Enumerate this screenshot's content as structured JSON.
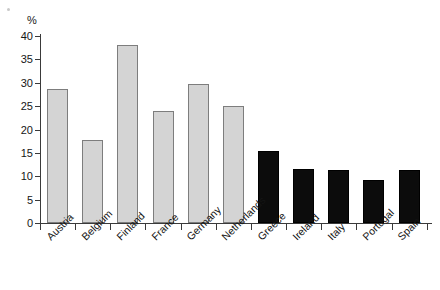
{
  "chart_data": {
    "type": "bar",
    "title": "",
    "subtitle": "",
    "xlabel": "",
    "ylabel": "%",
    "ylim": [
      0,
      40
    ],
    "ytick_values": [
      0,
      5,
      10,
      15,
      20,
      25,
      30,
      35,
      40
    ],
    "ytick_labels": [
      "0",
      "5",
      "10",
      "15",
      "20",
      "25",
      "30",
      "35",
      "40"
    ],
    "grid": false,
    "legend": null,
    "categories": [
      "Austria",
      "Belgium",
      "Finland",
      "France",
      "Germany",
      "Netherlands",
      "Greece",
      "Ireland",
      "Italy",
      "Portugal",
      "Spain"
    ],
    "values": [
      28.7,
      17.8,
      38.0,
      24.0,
      29.8,
      25.0,
      15.4,
      11.5,
      11.3,
      9.2,
      11.3
    ],
    "bar_colors": [
      "#d4d4d4",
      "#d4d4d4",
      "#d4d4d4",
      "#d4d4d4",
      "#d4d4d4",
      "#d4d4d4",
      "#0c0c0c",
      "#0c0c0c",
      "#0c0c0c",
      "#0c0c0c",
      "#0c0c0c"
    ],
    "bar_groups": [
      "light",
      "light",
      "light",
      "light",
      "light",
      "light",
      "dark",
      "dark",
      "dark",
      "dark",
      "dark"
    ],
    "colors": {
      "light_bar_fill": "#d4d4d4",
      "light_bar_edge": "#7d7d7d",
      "dark_bar_fill": "#0c0c0c",
      "dark_bar_edge": "#000000",
      "axis": "#3a3a3a",
      "text": "#141414",
      "background": "#ffffff"
    },
    "label_rotation_deg": -45
  }
}
